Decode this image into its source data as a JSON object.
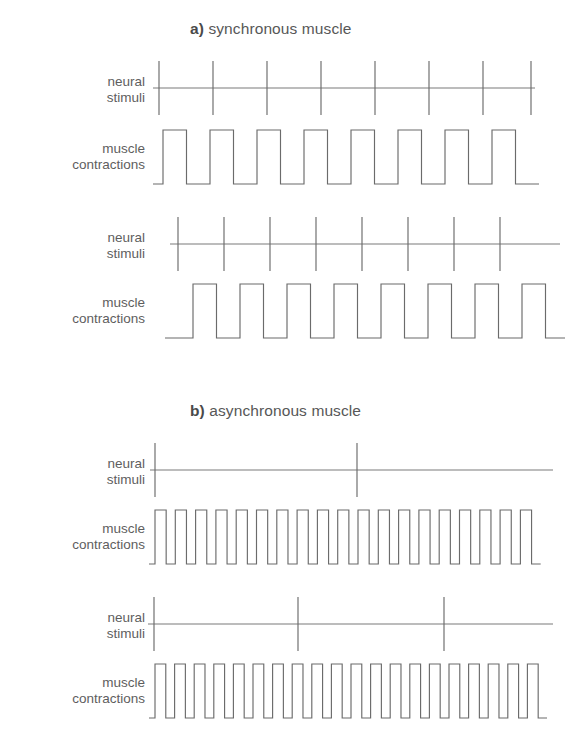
{
  "figure": {
    "background_color": "#ffffff",
    "line_color": "#6b6b6b",
    "text_color": "#5c5c5c"
  },
  "panels": [
    {
      "id": "a",
      "letter": "a)",
      "title": "synchronous muscle",
      "heading_top": 20
    },
    {
      "id": "b",
      "letter": "b)",
      "title": "asynchronous muscle",
      "heading_top": 402
    }
  ],
  "labels": {
    "neural_stimuli": [
      "neural",
      "stimuli"
    ],
    "muscle_contractions": [
      "muscle",
      "contractions"
    ]
  },
  "traces": [
    {
      "name": "a-neural-stimuli-1",
      "panel": "a",
      "kind": "stimuli",
      "label": "neural_stimuli",
      "top": 58,
      "height": 60,
      "label_top": 16,
      "plot_left": 145,
      "width": 400,
      "baseline_y": 30,
      "tick_half_height": 27,
      "line_start_x": 8,
      "line_end_x": 390,
      "stimuli_count": 8,
      "stimuli_x": [
        14,
        68,
        122,
        176,
        230,
        284,
        338,
        386
      ]
    },
    {
      "name": "a-muscle-contractions-1",
      "panel": "a",
      "kind": "contractions",
      "label": "muscle_contractions",
      "top": 124,
      "height": 66,
      "label_top": 17,
      "plot_left": 145,
      "width": 400,
      "baseline_y": 60,
      "peak_y": 6,
      "pulse_count": 8,
      "duty_cycle": 0.5,
      "lead_in": 10,
      "period": 47,
      "start_x": 8
    },
    {
      "name": "a-neural-stimuli-2",
      "panel": "a",
      "kind": "stimuli",
      "label": "neural_stimuli",
      "top": 214,
      "height": 60,
      "label_top": 16,
      "plot_left": 145,
      "width": 420,
      "baseline_y": 30,
      "tick_half_height": 27,
      "line_start_x": 25,
      "line_end_x": 415,
      "stimuli_count": 8,
      "stimuli_x": [
        33,
        79,
        125,
        171,
        217,
        263,
        309,
        355
      ]
    },
    {
      "name": "a-muscle-contractions-2",
      "panel": "a",
      "kind": "contractions",
      "label": "muscle_contractions",
      "top": 278,
      "height": 66,
      "label_top": 17,
      "plot_left": 145,
      "width": 420,
      "baseline_y": 60,
      "peak_y": 6,
      "pulse_count": 8,
      "duty_cycle": 0.5,
      "lead_in": 28,
      "period": 47,
      "start_x": 20
    },
    {
      "name": "b-neural-stimuli-1",
      "panel": "b",
      "kind": "stimuli",
      "label": "neural_stimuli",
      "top": 440,
      "height": 60,
      "label_top": 16,
      "plot_left": 145,
      "width": 420,
      "baseline_y": 30,
      "tick_half_height": 27,
      "line_start_x": 5,
      "line_end_x": 408,
      "stimuli_count": 2,
      "stimuli_x": [
        10,
        212
      ]
    },
    {
      "name": "b-muscle-contractions-1",
      "panel": "b",
      "kind": "contractions",
      "label": "muscle_contractions",
      "top": 504,
      "height": 66,
      "label_top": 17,
      "plot_left": 145,
      "width": 420,
      "baseline_y": 60,
      "peak_y": 6,
      "pulse_count": 19,
      "duty_cycle": 0.55,
      "lead_in": 6,
      "period": 20.3,
      "start_x": 4
    },
    {
      "name": "b-neural-stimuli-2",
      "panel": "b",
      "kind": "stimuli",
      "label": "neural_stimuli",
      "top": 594,
      "height": 60,
      "label_top": 16,
      "plot_left": 145,
      "width": 420,
      "baseline_y": 30,
      "tick_half_height": 27,
      "line_start_x": 3,
      "line_end_x": 408,
      "stimuli_count": 3,
      "stimuli_x": [
        9,
        153,
        299
      ]
    },
    {
      "name": "b-muscle-contractions-2",
      "panel": "b",
      "kind": "contractions",
      "label": "muscle_contractions",
      "top": 658,
      "height": 66,
      "label_top": 17,
      "plot_left": 145,
      "width": 420,
      "baseline_y": 60,
      "peak_y": 6,
      "pulse_count": 20,
      "duty_cycle": 0.55,
      "lead_in": 6,
      "period": 19.6,
      "start_x": 4
    }
  ]
}
